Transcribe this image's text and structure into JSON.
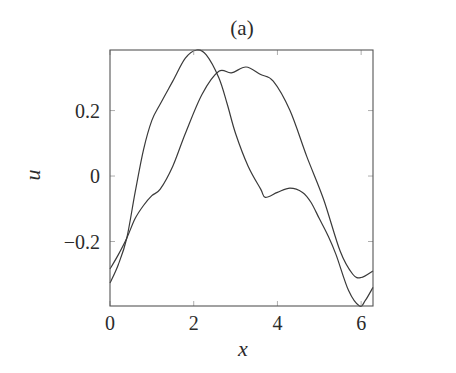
{
  "chart_data": {
    "type": "line",
    "title": "(a)",
    "xlabel": "x",
    "ylabel": "u",
    "xlim": [
      0,
      6.2832
    ],
    "ylim": [
      -0.397,
      0.385
    ],
    "xticks": [
      0,
      2,
      4,
      6
    ],
    "xtick_labels": [
      "0",
      "2",
      "4",
      "6"
    ],
    "yticks": [
      -0.2,
      0,
      0.2
    ],
    "ytick_labels": [
      "−0.2",
      "0",
      "0.2"
    ],
    "grid": false,
    "legend": null,
    "line_color": "#3a3a3a",
    "series": [
      {
        "name": "curve-1",
        "x": [
          0,
          0.2,
          0.4,
          0.6,
          0.8,
          1.0,
          1.2,
          1.5,
          1.8,
          2.07,
          2.3,
          2.6,
          2.8,
          3.0,
          3.3,
          3.6,
          3.71,
          4.0,
          4.3,
          4.6,
          4.8,
          5.0,
          5.2,
          5.4,
          5.7,
          5.96,
          6.1,
          6.2832
        ],
        "y": [
          -0.327,
          -0.27,
          -0.19,
          -0.05,
          0.08,
          0.17,
          0.22,
          0.29,
          0.36,
          0.385,
          0.37,
          0.3,
          0.22,
          0.13,
          0.03,
          -0.04,
          -0.065,
          -0.05,
          -0.037,
          -0.05,
          -0.08,
          -0.13,
          -0.18,
          -0.24,
          -0.35,
          -0.397,
          -0.38,
          -0.34
        ]
      },
      {
        "name": "curve-2",
        "x": [
          0,
          0.2,
          0.4,
          0.6,
          0.8,
          1.0,
          1.2,
          1.5,
          1.8,
          2.2,
          2.6,
          2.9,
          3.25,
          3.6,
          3.9,
          4.3,
          4.7,
          5.1,
          5.5,
          5.8,
          6.0,
          6.2832
        ],
        "y": [
          -0.284,
          -0.24,
          -0.19,
          -0.13,
          -0.09,
          -0.06,
          -0.04,
          0.03,
          0.13,
          0.25,
          0.32,
          0.315,
          0.333,
          0.31,
          0.29,
          0.2,
          0.06,
          -0.07,
          -0.23,
          -0.3,
          -0.31,
          -0.29
        ]
      }
    ]
  }
}
